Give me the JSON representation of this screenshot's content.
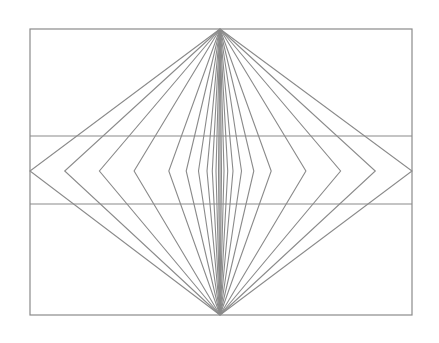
{
  "canvas": {
    "width": 439,
    "height": 343,
    "background_color": "#ffffff",
    "title": "Wundt-Hering style radiating diamond illusion"
  },
  "style": {
    "line_color": "#8a8a8a",
    "frame_color": "#8a8a8a",
    "line_width": 1.1,
    "frame_width": 1.2
  },
  "chart_data": {
    "type": "line",
    "subtitle": "",
    "xlabel": "",
    "ylabel": "",
    "grid": false,
    "legend": "none",
    "xlim": [
      0,
      439
    ],
    "ylim": [
      0,
      343
    ],
    "frame": {
      "name": "outer-rectangle",
      "left": 30,
      "top": 29,
      "right": 412,
      "bottom": 315
    },
    "diamond": {
      "name": "diamond-outline",
      "top_apex": [
        220,
        29
      ],
      "bottom_apex": [
        220,
        315
      ],
      "left_vertex": [
        30,
        171
      ],
      "right_vertex": [
        412,
        171
      ],
      "mid_axis_y": 171
    },
    "horizontal_transversals": [
      {
        "name": "upper-transversal",
        "y": 136,
        "x_start": 30,
        "x_end": 412
      },
      {
        "name": "lower-transversal",
        "y": 204,
        "x_start": 30,
        "x_end": 412
      }
    ],
    "radiating_lines": {
      "count": 23,
      "origin_top": [
        220,
        29
      ],
      "origin_bottom": [
        220,
        315
      ],
      "mid_axis_y": 171,
      "mid_x_values": [
        30,
        64.7,
        99.4,
        134.1,
        168.8,
        186.2,
        198.5,
        207.0,
        212.3,
        216.0,
        218.5,
        220,
        221.5,
        224.0,
        227.7,
        233.0,
        241.5,
        253.8,
        271.2,
        305.9,
        340.6,
        375.3,
        412
      ]
    },
    "series": [
      {
        "name": "radiating-line-0",
        "points": [
          [
            220,
            29
          ],
          [
            30,
            171
          ],
          [
            220,
            315
          ]
        ]
      },
      {
        "name": "radiating-line-1",
        "points": [
          [
            220,
            29
          ],
          [
            64.7,
            171
          ],
          [
            220,
            315
          ]
        ]
      },
      {
        "name": "radiating-line-2",
        "points": [
          [
            220,
            29
          ],
          [
            99.4,
            171
          ],
          [
            220,
            315
          ]
        ]
      },
      {
        "name": "radiating-line-3",
        "points": [
          [
            220,
            29
          ],
          [
            134.1,
            171
          ],
          [
            220,
            315
          ]
        ]
      },
      {
        "name": "radiating-line-4",
        "points": [
          [
            220,
            29
          ],
          [
            168.8,
            171
          ],
          [
            220,
            315
          ]
        ]
      },
      {
        "name": "radiating-line-5",
        "points": [
          [
            220,
            29
          ],
          [
            186.2,
            171
          ],
          [
            220,
            315
          ]
        ]
      },
      {
        "name": "radiating-line-6",
        "points": [
          [
            220,
            29
          ],
          [
            198.5,
            171
          ],
          [
            220,
            315
          ]
        ]
      },
      {
        "name": "radiating-line-7",
        "points": [
          [
            220,
            29
          ],
          [
            207.0,
            171
          ],
          [
            220,
            315
          ]
        ]
      },
      {
        "name": "radiating-line-8",
        "points": [
          [
            220,
            29
          ],
          [
            212.3,
            171
          ],
          [
            220,
            315
          ]
        ]
      },
      {
        "name": "radiating-line-9",
        "points": [
          [
            220,
            29
          ],
          [
            216.0,
            171
          ],
          [
            220,
            315
          ]
        ]
      },
      {
        "name": "radiating-line-10",
        "points": [
          [
            220,
            29
          ],
          [
            218.5,
            171
          ],
          [
            220,
            315
          ]
        ]
      },
      {
        "name": "radiating-line-11-center",
        "points": [
          [
            220,
            29
          ],
          [
            220,
            171
          ],
          [
            220,
            315
          ]
        ]
      },
      {
        "name": "radiating-line-12",
        "points": [
          [
            220,
            29
          ],
          [
            221.5,
            171
          ],
          [
            220,
            315
          ]
        ]
      },
      {
        "name": "radiating-line-13",
        "points": [
          [
            220,
            29
          ],
          [
            224.0,
            171
          ],
          [
            220,
            315
          ]
        ]
      },
      {
        "name": "radiating-line-14",
        "points": [
          [
            220,
            29
          ],
          [
            227.7,
            171
          ],
          [
            220,
            315
          ]
        ]
      },
      {
        "name": "radiating-line-15",
        "points": [
          [
            220,
            29
          ],
          [
            233.0,
            171
          ],
          [
            220,
            315
          ]
        ]
      },
      {
        "name": "radiating-line-16",
        "points": [
          [
            220,
            29
          ],
          [
            241.5,
            171
          ],
          [
            220,
            315
          ]
        ]
      },
      {
        "name": "radiating-line-17",
        "points": [
          [
            220,
            29
          ],
          [
            253.8,
            171
          ],
          [
            220,
            315
          ]
        ]
      },
      {
        "name": "radiating-line-18",
        "points": [
          [
            220,
            29
          ],
          [
            271.2,
            171
          ],
          [
            220,
            315
          ]
        ]
      },
      {
        "name": "radiating-line-19",
        "points": [
          [
            220,
            29
          ],
          [
            305.9,
            171
          ],
          [
            220,
            315
          ]
        ]
      },
      {
        "name": "radiating-line-20",
        "points": [
          [
            220,
            29
          ],
          [
            340.6,
            171
          ],
          [
            220,
            315
          ]
        ]
      },
      {
        "name": "radiating-line-21",
        "points": [
          [
            220,
            29
          ],
          [
            375.3,
            171
          ],
          [
            220,
            315
          ]
        ]
      },
      {
        "name": "radiating-line-22",
        "points": [
          [
            220,
            29
          ],
          [
            412,
            171
          ],
          [
            220,
            315
          ]
        ]
      }
    ]
  }
}
